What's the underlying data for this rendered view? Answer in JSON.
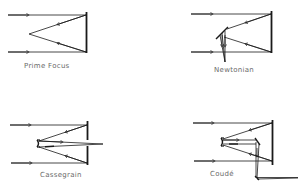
{
  "diagrams": [
    {
      "id": "prime-focus",
      "label": "Prime Focus"
    },
    {
      "id": "newtonian",
      "label": "Newtonian"
    },
    {
      "id": "cassegrain",
      "label": "Cassegrain"
    },
    {
      "id": "coude",
      "label": "Coudé"
    }
  ],
  "colors": {
    "line": "#1a1a1a",
    "label": "#6a6a6a",
    "background": "#ffffff"
  }
}
